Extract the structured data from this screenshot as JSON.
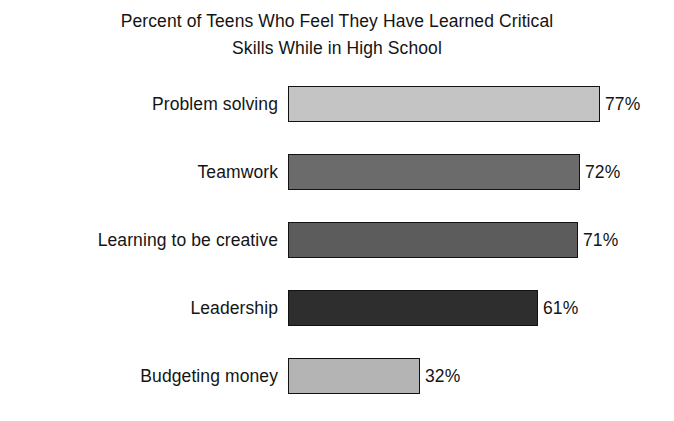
{
  "chart_data": {
    "type": "bar",
    "orientation": "horizontal",
    "title": "Percent of Teens Who Feel They Have Learned Critical Skills While in High School",
    "title_lines": [
      "Percent of Teens Who Feel They Have Learned Critical",
      "Skills While in High School"
    ],
    "xlabel": "",
    "ylabel": "",
    "xlim": [
      0,
      100
    ],
    "grid": false,
    "legend": false,
    "axes_visible": false,
    "background_color": "#ffffff",
    "text_color": "#141414",
    "bar_border_color": "#121212",
    "categories": [
      "Problem solving",
      "Teamwork",
      "Learning to be creative",
      "Leadership",
      "Budgeting money"
    ],
    "values": [
      77,
      72,
      71,
      61,
      32
    ],
    "value_labels": [
      "77%",
      "72%",
      "71%",
      "61%",
      "32%"
    ],
    "bar_colors": [
      "#c4c4c4",
      "#6b6b6b",
      "#5c5c5c",
      "#2e2e2e",
      "#b4b4b4"
    ],
    "bar_pixel_widths": [
      312,
      292,
      290,
      250,
      132
    ],
    "bars": [
      {
        "category": "Problem solving",
        "value": 77,
        "value_label": "77%",
        "color": "#c4c4c4",
        "pixel_width": 312
      },
      {
        "category": "Teamwork",
        "value": 72,
        "value_label": "72%",
        "color": "#6b6b6b",
        "pixel_width": 292
      },
      {
        "category": "Learning to be creative",
        "value": 71,
        "value_label": "71%",
        "color": "#5c5c5c",
        "pixel_width": 290
      },
      {
        "category": "Leadership",
        "value": 61,
        "value_label": "61%",
        "color": "#2e2e2e",
        "pixel_width": 250
      },
      {
        "category": "Budgeting money",
        "value": 32,
        "value_label": "32%",
        "color": "#b4b4b4",
        "pixel_width": 132
      }
    ]
  }
}
